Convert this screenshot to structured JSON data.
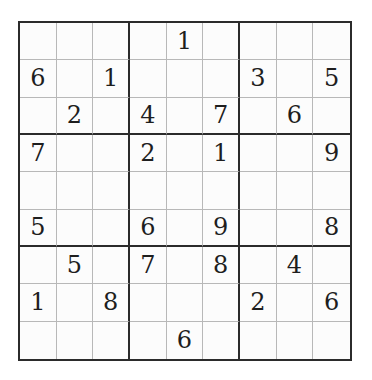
{
  "puzzle": {
    "type": "sudoku",
    "size": 9,
    "grid": [
      [
        "",
        "",
        "",
        "",
        "1",
        "",
        "",
        "",
        ""
      ],
      [
        "6",
        "",
        "1",
        "",
        "",
        "",
        "3",
        "",
        "5"
      ],
      [
        "",
        "2",
        "",
        "4",
        "",
        "7",
        "",
        "6",
        ""
      ],
      [
        "7",
        "",
        "",
        "2",
        "",
        "1",
        "",
        "",
        "9"
      ],
      [
        "",
        "",
        "",
        "",
        "",
        "",
        "",
        "",
        ""
      ],
      [
        "5",
        "",
        "",
        "6",
        "",
        "9",
        "",
        "",
        "8"
      ],
      [
        "",
        "5",
        "",
        "7",
        "",
        "8",
        "",
        "4",
        ""
      ],
      [
        "1",
        "",
        "8",
        "",
        "",
        "",
        "2",
        "",
        "6"
      ],
      [
        "",
        "",
        "",
        "",
        "6",
        "",
        "",
        "",
        ""
      ]
    ]
  }
}
